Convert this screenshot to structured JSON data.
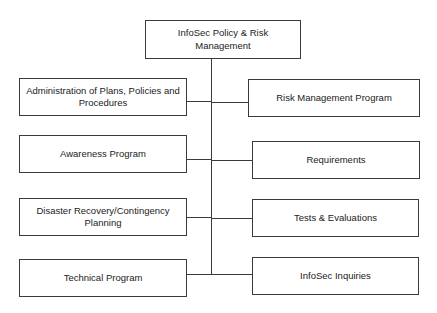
{
  "diagram": {
    "type": "org-chart",
    "root": {
      "label": "InfoSec Policy & Risk Management"
    },
    "left_branches": [
      {
        "label": "Administration of Plans, Policies and Procedures"
      },
      {
        "label": "Awareness Program"
      },
      {
        "label": "Disaster Recovery/Contingency Planning"
      },
      {
        "label": "Technical Program"
      }
    ],
    "right_branches": [
      {
        "label": "Risk Management Program"
      },
      {
        "label": "Requirements"
      },
      {
        "label": "Tests & Evaluations"
      },
      {
        "label": "InfoSec Inquiries"
      }
    ],
    "colors": {
      "line": "#3a3a3a",
      "text": "#222222",
      "background": "#ffffff"
    }
  }
}
